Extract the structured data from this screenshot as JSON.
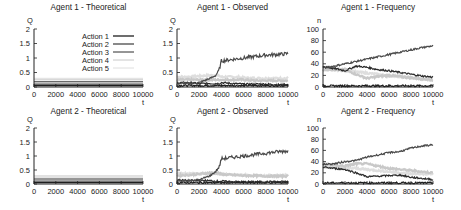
{
  "figure": {
    "legend": {
      "entries": [
        {
          "label": "Action 1",
          "color": "#1e1e1e",
          "width": 1.3
        },
        {
          "label": "Action 2",
          "color": "#4a4a4a",
          "width": 1.3
        },
        {
          "label": "Action 3",
          "color": "#2c2c2c",
          "width": 1.0
        },
        {
          "label": "Action 4",
          "color": "#c8c8c8",
          "width": 1.0
        },
        {
          "label": "Action 5",
          "color": "#dedede",
          "width": 1.0
        }
      ]
    }
  },
  "chart_data": [
    {
      "id": "a1-theoretical",
      "type": "line",
      "title": "Agent 1 - Theoretical",
      "xlabel": "t",
      "ylabel": "Q",
      "xlim": [
        0,
        10000
      ],
      "ylim": [
        0,
        2
      ],
      "xticks": [
        "0",
        "2000",
        "4000",
        "6000",
        "8000",
        "10000"
      ],
      "yticks": [
        "0",
        "0.5",
        "1",
        "1.5",
        "2"
      ],
      "grid": false,
      "legend_position": "upper right",
      "x": [
        0,
        10000
      ],
      "series": [
        {
          "name": "Action 1",
          "values": [
            0.05,
            0.05
          ]
        },
        {
          "name": "Action 2",
          "values": [
            0.1,
            0.1
          ]
        },
        {
          "name": "Action 3",
          "values": [
            0.18,
            0.18
          ]
        },
        {
          "name": "Action 4",
          "values": [
            0.25,
            0.25
          ]
        },
        {
          "name": "Action 5",
          "values": [
            0.3,
            0.3
          ]
        }
      ]
    },
    {
      "id": "a1-observed",
      "type": "line",
      "title": "Agent 1 - Observed",
      "xlabel": "t",
      "ylabel": "Q",
      "xlim": [
        0,
        10000
      ],
      "ylim": [
        0,
        2
      ],
      "xticks": [
        "0",
        "2000",
        "4000",
        "6000",
        "8000",
        "10000"
      ],
      "yticks": [
        "0",
        "0.5",
        "1",
        "1.5",
        "2"
      ],
      "grid": false,
      "x": [
        0,
        1000,
        2000,
        3000,
        3500,
        3800,
        4000,
        5000,
        6000,
        7000,
        8000,
        9000,
        10000
      ],
      "series": [
        {
          "name": "Action 1",
          "values": [
            0.05,
            0.05,
            0.05,
            0.05,
            0.05,
            0.05,
            0.05,
            0.05,
            0.05,
            0.05,
            0.05,
            0.05,
            0.05
          ]
        },
        {
          "name": "Action 2",
          "values": [
            0.12,
            0.12,
            0.15,
            0.3,
            0.4,
            0.6,
            0.9,
            0.95,
            1.0,
            1.05,
            1.1,
            1.12,
            1.15
          ]
        },
        {
          "name": "Action 3",
          "values": [
            0.15,
            0.15,
            0.12,
            0.12,
            0.12,
            0.12,
            0.15,
            0.12,
            0.1,
            0.1,
            0.1,
            0.08,
            0.08
          ]
        },
        {
          "name": "Action 4",
          "values": [
            0.25,
            0.25,
            0.25,
            0.25,
            0.25,
            0.25,
            0.25,
            0.25,
            0.25,
            0.22,
            0.22,
            0.22,
            0.22
          ]
        },
        {
          "name": "Action 5",
          "values": [
            0.35,
            0.35,
            0.38,
            0.4,
            0.4,
            0.38,
            0.35,
            0.35,
            0.32,
            0.3,
            0.3,
            0.3,
            0.3
          ]
        }
      ]
    },
    {
      "id": "a1-frequency",
      "type": "line",
      "title": "Agent 1 - Frequency",
      "xlabel": "t",
      "ylabel": "n",
      "xlim": [
        0,
        10000
      ],
      "ylim": [
        0,
        100
      ],
      "xticks": [
        "0",
        "2000",
        "4000",
        "6000",
        "8000",
        "10000"
      ],
      "yticks": [
        "0",
        "20",
        "40",
        "60",
        "80",
        "100"
      ],
      "grid": false,
      "x": [
        0,
        1000,
        2000,
        3000,
        4000,
        5000,
        6000,
        7000,
        8000,
        9000,
        10000
      ],
      "series": [
        {
          "name": "Action 1",
          "values": [
            2,
            2,
            2,
            2,
            2,
            2,
            2,
            2,
            2,
            2,
            2
          ]
        },
        {
          "name": "Action 2",
          "values": [
            33,
            36,
            40,
            44,
            48,
            52,
            56,
            60,
            64,
            68,
            71
          ]
        },
        {
          "name": "Action 3",
          "values": [
            35,
            32,
            28,
            36,
            34,
            30,
            28,
            25,
            22,
            19,
            17
          ]
        },
        {
          "name": "Action 4",
          "values": [
            30,
            30,
            30,
            22,
            15,
            18,
            20,
            18,
            16,
            14,
            12
          ]
        },
        {
          "name": "Action 5",
          "values": [
            32,
            30,
            28,
            26,
            24,
            22,
            20,
            18,
            16,
            14,
            12
          ]
        }
      ]
    },
    {
      "id": "a2-theoretical",
      "type": "line",
      "title": "Agent 2 - Theoretical",
      "xlabel": "t",
      "ylabel": "Q",
      "xlim": [
        0,
        10000
      ],
      "ylim": [
        0,
        2
      ],
      "xticks": [
        "0",
        "2000",
        "4000",
        "6000",
        "8000",
        "10000"
      ],
      "yticks": [
        "0",
        "0.5",
        "1",
        "1.5",
        "2"
      ],
      "grid": false,
      "x": [
        0,
        10000
      ],
      "series": [
        {
          "name": "Action 1",
          "values": [
            0.05,
            0.05
          ]
        },
        {
          "name": "Action 2",
          "values": [
            0.1,
            0.1
          ]
        },
        {
          "name": "Action 3",
          "values": [
            0.18,
            0.18
          ]
        },
        {
          "name": "Action 4",
          "values": [
            0.25,
            0.25
          ]
        },
        {
          "name": "Action 5",
          "values": [
            0.3,
            0.3
          ]
        }
      ]
    },
    {
      "id": "a2-observed",
      "type": "line",
      "title": "Agent 2 - Observed",
      "xlabel": "t",
      "ylabel": "Q",
      "xlim": [
        0,
        10000
      ],
      "ylim": [
        0,
        2
      ],
      "xticks": [
        "0",
        "2000",
        "4000",
        "6000",
        "8000",
        "10000"
      ],
      "yticks": [
        "0",
        "0.5",
        "1",
        "1.5",
        "2"
      ],
      "grid": false,
      "x": [
        0,
        1000,
        2000,
        3000,
        3500,
        3800,
        4000,
        5000,
        6000,
        7000,
        8000,
        9000,
        10000
      ],
      "series": [
        {
          "name": "Action 1",
          "values": [
            0.05,
            0.05,
            0.05,
            0.05,
            0.05,
            0.05,
            0.05,
            0.05,
            0.05,
            0.05,
            0.05,
            0.05,
            0.05
          ]
        },
        {
          "name": "Action 2",
          "values": [
            0.1,
            0.12,
            0.15,
            0.3,
            0.45,
            0.6,
            0.9,
            0.95,
            1.0,
            1.05,
            1.1,
            1.15,
            1.18
          ]
        },
        {
          "name": "Action 3",
          "values": [
            0.15,
            0.12,
            0.12,
            0.12,
            0.1,
            0.1,
            0.1,
            0.08,
            0.08,
            0.08,
            0.08,
            0.08,
            0.08
          ]
        },
        {
          "name": "Action 4",
          "values": [
            0.3,
            0.32,
            0.35,
            0.4,
            0.4,
            0.38,
            0.35,
            0.32,
            0.3,
            0.3,
            0.28,
            0.28,
            0.28
          ]
        },
        {
          "name": "Action 5",
          "values": [
            0.38,
            0.38,
            0.38,
            0.38,
            0.38,
            0.36,
            0.35,
            0.33,
            0.32,
            0.3,
            0.3,
            0.3,
            0.3
          ]
        }
      ]
    },
    {
      "id": "a2-frequency",
      "type": "line",
      "title": "Agent 2 - Frequency",
      "xlabel": "t",
      "ylabel": "n",
      "xlim": [
        0,
        10000
      ],
      "ylim": [
        0,
        100
      ],
      "xticks": [
        "0",
        "2000",
        "4000",
        "6000",
        "8000",
        "10000"
      ],
      "yticks": [
        "0",
        "20",
        "40",
        "60",
        "80",
        "100"
      ],
      "grid": false,
      "x": [
        0,
        1000,
        2000,
        3000,
        4000,
        5000,
        6000,
        7000,
        8000,
        9000,
        10000
      ],
      "series": [
        {
          "name": "Action 1",
          "values": [
            2,
            2,
            2,
            2,
            2,
            2,
            2,
            2,
            2,
            2,
            2
          ]
        },
        {
          "name": "Action 2",
          "values": [
            35,
            36,
            40,
            42,
            48,
            52,
            56,
            58,
            64,
            68,
            70
          ]
        },
        {
          "name": "Action 3",
          "values": [
            30,
            28,
            26,
            20,
            13,
            14,
            15,
            16,
            12,
            10,
            8
          ]
        },
        {
          "name": "Action 4",
          "values": [
            36,
            34,
            32,
            36,
            36,
            32,
            28,
            26,
            24,
            22,
            20
          ]
        },
        {
          "name": "Action 5",
          "values": [
            30,
            30,
            28,
            28,
            26,
            24,
            22,
            20,
            18,
            18,
            18
          ]
        }
      ]
    }
  ]
}
